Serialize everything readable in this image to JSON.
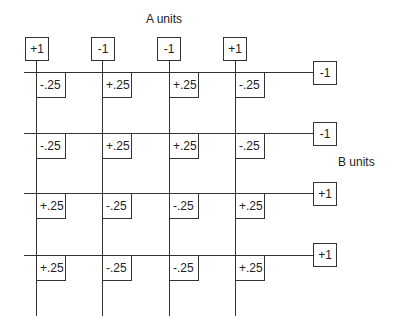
{
  "title_a": "A units",
  "title_b": "B units",
  "a_units": [
    "+1",
    "-1",
    "-1",
    "+1"
  ],
  "b_units": [
    "-1",
    "-1",
    "+1",
    "+1"
  ],
  "weights": [
    [
      "-.25",
      "+.25",
      "+.25",
      "-.25"
    ],
    [
      "-.25",
      "+.25",
      "+.25",
      "-.25"
    ],
    [
      "+.25",
      "-.25",
      "-.25",
      "+.25"
    ],
    [
      "+.25",
      "-.25",
      "-.25",
      "+.25"
    ]
  ]
}
